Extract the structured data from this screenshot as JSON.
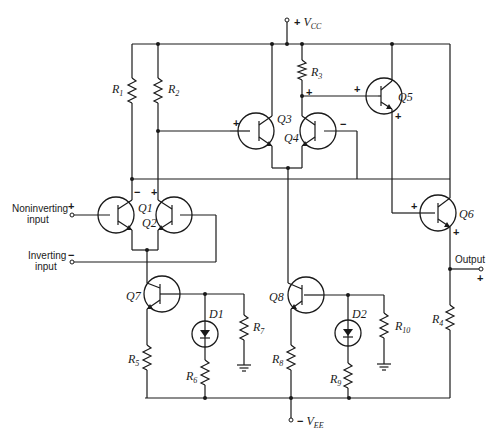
{
  "diagram": {
    "supplies": {
      "positive": {
        "sign": "+",
        "label": "V",
        "subscript": "CC"
      },
      "negative": {
        "sign": "−",
        "label": "V",
        "subscript": "EE"
      }
    },
    "inputs": {
      "noninverting": {
        "line1": "Noninverting",
        "line2": "input",
        "sign": "+"
      },
      "inverting": {
        "line1": "Inverting",
        "line2": "input",
        "sign": "−"
      }
    },
    "output": {
      "label": "Output",
      "sign": "+"
    },
    "transistors": [
      {
        "id": "Q1",
        "label": "Q1"
      },
      {
        "id": "Q2",
        "label": "Q2"
      },
      {
        "id": "Q3",
        "label": "Q3"
      },
      {
        "id": "Q4",
        "label": "Q4"
      },
      {
        "id": "Q5",
        "label": "Q5"
      },
      {
        "id": "Q6",
        "label": "Q6"
      },
      {
        "id": "Q7",
        "label": "Q7"
      },
      {
        "id": "Q8",
        "label": "Q8"
      }
    ],
    "resistors": [
      {
        "id": "R1",
        "label": "R",
        "subscript": "1"
      },
      {
        "id": "R2",
        "label": "R",
        "subscript": "2"
      },
      {
        "id": "R3",
        "label": "R",
        "subscript": "3"
      },
      {
        "id": "R4",
        "label": "R",
        "subscript": "4"
      },
      {
        "id": "R5",
        "label": "R",
        "subscript": "5"
      },
      {
        "id": "R6",
        "label": "R",
        "subscript": "6"
      },
      {
        "id": "R7",
        "label": "R",
        "subscript": "7"
      },
      {
        "id": "R8",
        "label": "R",
        "subscript": "8"
      },
      {
        "id": "R9",
        "label": "R",
        "subscript": "9"
      },
      {
        "id": "R10",
        "label": "R",
        "subscript": "10"
      }
    ],
    "diodes": [
      {
        "id": "D1",
        "label": "D1"
      },
      {
        "id": "D2",
        "label": "D2"
      }
    ],
    "polarity_marks": {
      "plus": "+",
      "minus": "−"
    }
  }
}
